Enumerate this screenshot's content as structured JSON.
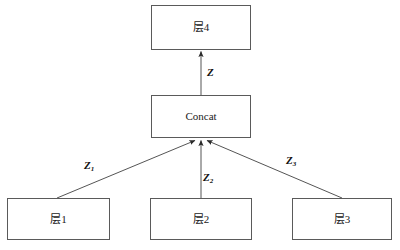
{
  "diagram": {
    "background_color": "#ffffff",
    "stroke_color": "#5a5a5a",
    "edge_color": "#3a3a3a",
    "text_color": "#1a1a1a",
    "nodes": [
      {
        "id": "layer4",
        "label": "层4",
        "x": 151,
        "y": 5,
        "w": 100,
        "h": 45
      },
      {
        "id": "concat",
        "label": "Concat",
        "x": 151,
        "y": 95,
        "w": 100,
        "h": 43
      },
      {
        "id": "layer1",
        "label": "层1",
        "x": 7,
        "y": 198,
        "w": 103,
        "h": 42
      },
      {
        "id": "layer2",
        "label": "层2",
        "x": 150,
        "y": 198,
        "w": 102,
        "h": 42
      },
      {
        "id": "layer3",
        "label": "层3",
        "x": 292,
        "y": 198,
        "w": 100,
        "h": 42
      }
    ],
    "edges": [
      {
        "id": "edge-concat-to-layer4",
        "from": "concat",
        "to": "layer4",
        "label": "Z",
        "subscript": ""
      },
      {
        "id": "edge-layer1-to-concat",
        "from": "layer1",
        "to": "concat",
        "label": "Z",
        "subscript": "1"
      },
      {
        "id": "edge-layer2-to-concat",
        "from": "layer2",
        "to": "concat",
        "label": "Z",
        "subscript": "2"
      },
      {
        "id": "edge-layer3-to-concat",
        "from": "layer3",
        "to": "concat",
        "label": "Z",
        "subscript": "3"
      }
    ],
    "edge_labels": {
      "z_top": {
        "text": "Z",
        "sub": "",
        "x": 207,
        "y": 67
      },
      "z_one": {
        "text": "Z",
        "sub": "1",
        "x": 84,
        "y": 160
      },
      "z_two": {
        "text": "Z",
        "sub": "2",
        "x": 203,
        "y": 172
      },
      "z_three": {
        "text": "Z",
        "sub": "3",
        "x": 286,
        "y": 155
      }
    }
  }
}
